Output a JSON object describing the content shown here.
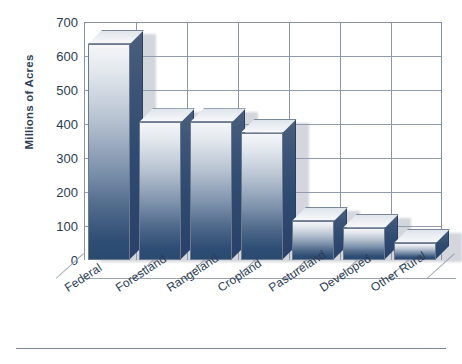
{
  "chart_data": {
    "type": "bar",
    "title": "",
    "subtitle": "",
    "xlabel": "",
    "ylabel": "Millions of Acres",
    "categories": [
      "Federal",
      "Forestland",
      "Rangeland",
      "Cropland",
      "Pastureland",
      "Developed",
      "Other Rural"
    ],
    "values": [
      635,
      405,
      405,
      375,
      115,
      95,
      50
    ],
    "series": [
      {
        "name": "Land Area",
        "values": [
          635,
          405,
          405,
          375,
          115,
          95,
          50
        ]
      }
    ],
    "ylim": [
      0,
      700
    ],
    "yticks": [
      0,
      100,
      200,
      300,
      400,
      500,
      600,
      700
    ],
    "ytick_labels": [
      "0",
      "100",
      "200",
      "300",
      "400",
      "500",
      "600",
      "700"
    ],
    "grid": "horizontal-and-vertical",
    "legend": "none",
    "legend_position": "none",
    "style": "3d-bars-gradient",
    "annotations": []
  },
  "axis": {
    "y_title": "Millions of Acres",
    "tick_labels": [
      "700",
      "600",
      "500",
      "400",
      "300",
      "200",
      "100",
      "0"
    ]
  },
  "colors": {
    "bar_top_light": "#f4f6f8",
    "bar_bottom_dark": "#2b4a70",
    "bar_side": "#2f4a70",
    "grid": "#909bad",
    "frame": "#8792a4",
    "text": "#2b3c54",
    "shadow": "#969eac",
    "background": "#ffffff"
  },
  "labels": {
    "cat_0": "Federal",
    "cat_1": "Forestland",
    "cat_2": "Rangeland",
    "cat_3": "Cropland",
    "cat_4": "Pastureland",
    "cat_5": "Developed",
    "cat_6": "Other Rural"
  }
}
